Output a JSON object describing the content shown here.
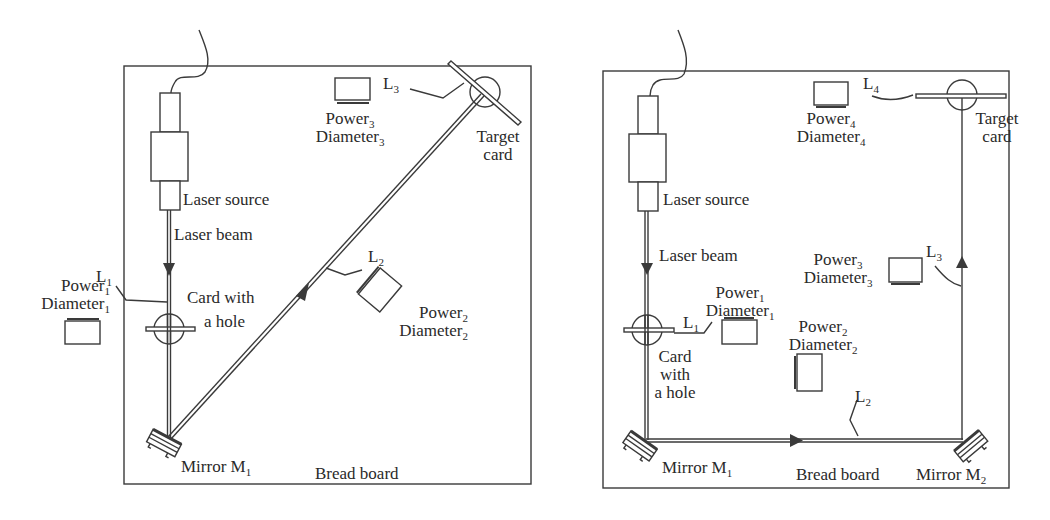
{
  "panels": [
    {
      "id": "left",
      "board_label": "Bread board",
      "laser_source": "Laser source",
      "laser_beam": "Laser beam",
      "card_hole": [
        "Card with",
        "a hole"
      ],
      "mirror1": {
        "name": "Mirror M",
        "sub": "1"
      },
      "target_card": [
        "Target",
        "card"
      ],
      "distances": [
        {
          "name": "L",
          "sub": "1"
        },
        {
          "name": "L",
          "sub": "2"
        },
        {
          "name": "L",
          "sub": "3"
        }
      ],
      "detectors": [
        {
          "power": "Power",
          "diameter": "Diameter",
          "sub": "1"
        },
        {
          "power": "Power",
          "diameter": "Diameter",
          "sub": "2"
        },
        {
          "power": "Power",
          "diameter": "Diameter",
          "sub": "3"
        }
      ]
    },
    {
      "id": "right",
      "board_label": "Bread board",
      "laser_source": "Laser source",
      "laser_beam": "Laser beam",
      "card_hole": [
        "Card",
        "with",
        "a hole"
      ],
      "mirror1": {
        "name": "Mirror M",
        "sub": "1"
      },
      "mirror2": {
        "name": "Mirror M",
        "sub": "2"
      },
      "target_card": [
        "Target",
        "card"
      ],
      "distances": [
        {
          "name": "L",
          "sub": "1"
        },
        {
          "name": "L",
          "sub": "2"
        },
        {
          "name": "L",
          "sub": "3"
        },
        {
          "name": "L",
          "sub": "4"
        }
      ],
      "detectors": [
        {
          "power": "Power",
          "diameter": "Diameter",
          "sub": "1"
        },
        {
          "power": "Power",
          "diameter": "Diameter",
          "sub": "2"
        },
        {
          "power": "Power",
          "diameter": "Diameter",
          "sub": "3"
        },
        {
          "power": "Power",
          "diameter": "Diameter",
          "sub": "4"
        }
      ]
    }
  ],
  "colors": {
    "line": "#3a3a3a",
    "background": "#ffffff"
  }
}
